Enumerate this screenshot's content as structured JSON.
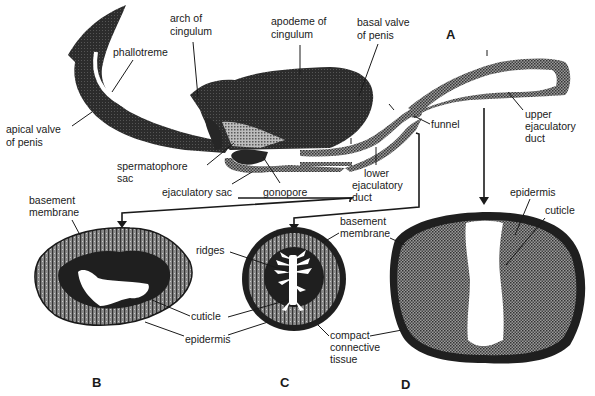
{
  "figure": {
    "panels": {
      "A": "A",
      "B": "B",
      "C": "C",
      "D": "D"
    },
    "labels_A": {
      "arch_of_cingulum": [
        "arch of",
        "cingulum"
      ],
      "apodeme_of_cingulum": [
        "apodeme of",
        "cingulum"
      ],
      "basal_valve": [
        "basal valve",
        "of penis"
      ],
      "phallotreme": [
        "phallotreme"
      ],
      "apical_valve": [
        "apical valve",
        "of penis"
      ],
      "spermatophore_sac": [
        "spermatophore",
        "sac"
      ],
      "ejaculatory_sac": [
        "ejaculatory sac"
      ],
      "gonopore": [
        "gonopore"
      ],
      "lower_ejaculatory_duct": [
        "lower",
        "ejaculatory",
        "duct"
      ],
      "funnel": [
        "funnel"
      ],
      "upper_ejaculatory_duct": [
        "upper",
        "ejaculatory",
        "duct"
      ]
    },
    "labels_B": {
      "basement_membrane": [
        "basement",
        "membrane"
      ],
      "cuticle": [
        "cuticle"
      ],
      "epidermis": [
        "epidermis"
      ]
    },
    "labels_C": {
      "ridges": [
        "ridges"
      ],
      "basement_membrane": [
        "basement",
        "membrane"
      ],
      "compact_connective_tissue": [
        "compact",
        "connective",
        "tissue"
      ]
    },
    "labels_D": {
      "epidermis": [
        "epidermis"
      ],
      "cuticle": [
        "cuticle"
      ]
    },
    "colors": {
      "ink": "#1a1a1a",
      "dark_fill": "#262626",
      "stipple": "#7a7a7a",
      "paper": "#ffffff"
    }
  }
}
